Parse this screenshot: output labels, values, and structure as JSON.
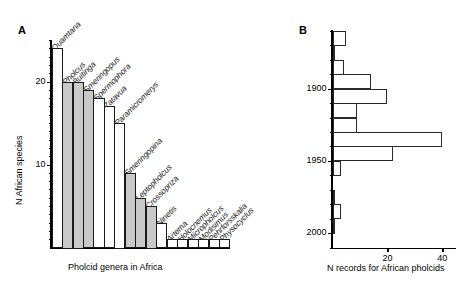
{
  "figure": {
    "panelA_letter": "A",
    "panelB_letter": "B"
  },
  "chart_data": [
    {
      "type": "bar",
      "panel": "A",
      "title": "",
      "xlabel": "Pholcid genera in Africa",
      "ylabel": "N African species",
      "orientation": "vertical",
      "ylim": [
        0,
        25
      ],
      "yticks": [
        10,
        20
      ],
      "ytick_labels": [
        "10",
        "20"
      ],
      "minor_tick_interval": 1,
      "grid": false,
      "legend": false,
      "categories": [
        "Quamtana",
        "Pholcus",
        "Buitinga",
        "Smeringopus",
        "Spermophora",
        "Zatavua",
        "Paramicromerys",
        "Smeringopina",
        "Leptopholcus",
        "Crossopriza",
        "Ninetis",
        "Artema",
        "Holocnemus",
        "Micropholcus",
        "Modisimus",
        "Pehrforsskalia",
        "Physocyclus"
      ],
      "values": [
        24,
        20,
        20,
        19,
        18,
        17,
        15,
        9,
        6,
        5,
        3,
        1,
        1,
        1,
        1,
        1,
        1
      ],
      "fills": [
        "white",
        "gray",
        "gray",
        "gray",
        "white",
        "white",
        "white",
        "gray",
        "gray",
        "gray",
        "white",
        "white",
        "white",
        "white",
        "white",
        "white",
        "white"
      ],
      "colors": {
        "gray": "#c9c9c9",
        "white": "#ffffff",
        "edge": "#1a1a1a"
      }
    },
    {
      "type": "bar",
      "panel": "B",
      "title": "",
      "xlabel": "N records for African pholcids",
      "ylabel": "",
      "orientation": "horizontal",
      "xlim": [
        0,
        45
      ],
      "xticks": [
        20,
        40
      ],
      "xtick_labels": [
        "20",
        "40"
      ],
      "yticks": [
        1900,
        1950,
        2000
      ],
      "ytick_labels": [
        "1900",
        "1950",
        "2000"
      ],
      "grid": false,
      "legend": false,
      "bin_width": 10,
      "categories": [
        "1865",
        "1875",
        "1885",
        "1895",
        "1905",
        "1915",
        "1925",
        "1935",
        "1945",
        "1955",
        "1965",
        "1975",
        "1985",
        "1995",
        "2005"
      ],
      "values": [
        5,
        1,
        4,
        14,
        20,
        9,
        9,
        40,
        22,
        3,
        0,
        1,
        3,
        1,
        0
      ],
      "colors": {
        "bar": "#ffffff",
        "edge": "#2a2a2a"
      }
    }
  ]
}
